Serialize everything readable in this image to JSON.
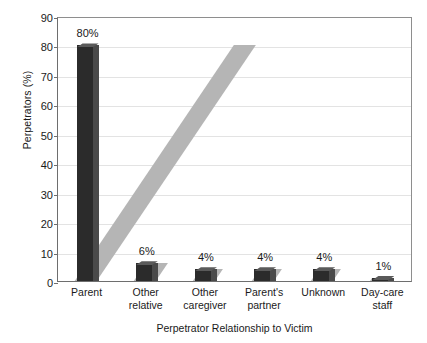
{
  "chart_data": {
    "type": "bar",
    "title": "",
    "subtitle": "",
    "xlabel": "Perpetrator Relationship to Victim",
    "ylabel": "Perpetrators (%)",
    "categories": [
      "Parent",
      "Other relative",
      "Other caregiver",
      "Parent's partner",
      "Unknown",
      "Day-care staff"
    ],
    "category_lines": [
      [
        "Parent"
      ],
      [
        "Other",
        "relative"
      ],
      [
        "Other",
        "caregiver"
      ],
      [
        "Parent's",
        "partner"
      ],
      [
        "Unknown"
      ],
      [
        "Day-care",
        "staff"
      ]
    ],
    "values": [
      80,
      6,
      4,
      4,
      4,
      1
    ],
    "data_labels": [
      "80%",
      "6%",
      "4%",
      "4%",
      "4%",
      "1%"
    ],
    "ylim": [
      0,
      90
    ],
    "ytick_step": 10,
    "yticks": [
      0,
      10,
      20,
      30,
      40,
      50,
      60,
      70,
      80,
      90
    ],
    "ytick_labels": [
      "0",
      "10",
      "20",
      "30",
      "40",
      "50",
      "60",
      "70",
      "80",
      "90"
    ],
    "grid": true,
    "grid_axis": "y",
    "legend": false,
    "legend_position": "none",
    "style": "3d-bars-with-shadow"
  },
  "colors": {
    "bar_front": "#2b2b2b",
    "bar_side": "#4a4a4a",
    "bar_top": "#5a5a5a",
    "shadow": "#b5b5b5",
    "gridline": "#e3e3e3",
    "axis": "#6e6e6e",
    "plot_border": "#8e8e8e",
    "text": "#1a1a1a",
    "background": "#ffffff"
  }
}
